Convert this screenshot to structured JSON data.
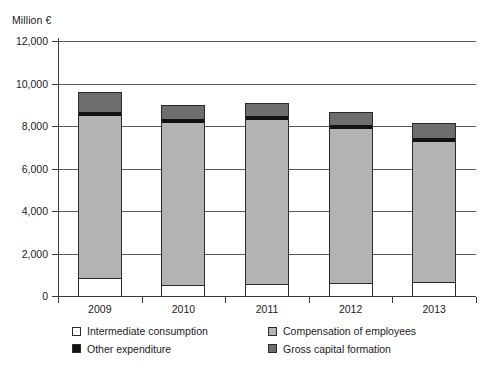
{
  "axis_unit_label": "Million €",
  "y_axis": {
    "ticks": [
      "0",
      "2,000",
      "4,000",
      "6,000",
      "8,000",
      "10,000",
      "12,000"
    ],
    "min": 0,
    "max": 12000
  },
  "x_axis": {
    "categories": [
      "2009",
      "2010",
      "2011",
      "2012",
      "2013"
    ]
  },
  "legend": {
    "items": [
      {
        "label": "Intermediate consumption",
        "color": "#ffffff",
        "swatch": "sw-inter"
      },
      {
        "label": "Compensation of employees",
        "color": "#b3b3b3",
        "swatch": "sw-comp"
      },
      {
        "label": "Other expenditure",
        "color": "#121212",
        "swatch": "sw-other"
      },
      {
        "label": "Gross capital formation",
        "color": "#6e6e6e",
        "swatch": "sw-gross"
      }
    ]
  },
  "chart_data": {
    "type": "bar",
    "stacked": true,
    "title": "",
    "xlabel": "",
    "ylabel": "Million €",
    "ylim": [
      0,
      12000
    ],
    "ytick_step": 2000,
    "grid": true,
    "legend_position": "bottom",
    "categories": [
      "2009",
      "2010",
      "2011",
      "2012",
      "2013"
    ],
    "series": [
      {
        "name": "Intermediate consumption",
        "color": "#ffffff",
        "values": [
          830,
          520,
          560,
          620,
          640
        ]
      },
      {
        "name": "Compensation of employees",
        "color": "#b3b3b3",
        "values": [
          7700,
          7660,
          7780,
          7260,
          6660
        ]
      },
      {
        "name": "Other expenditure",
        "color": "#121212",
        "values": [
          190,
          190,
          190,
          200,
          190
        ]
      },
      {
        "name": "Gross capital formation",
        "color": "#6e6e6e",
        "values": [
          880,
          630,
          570,
          570,
          660
        ]
      }
    ],
    "totals": [
      9600,
      9000,
      9100,
      8650,
      8150
    ]
  }
}
